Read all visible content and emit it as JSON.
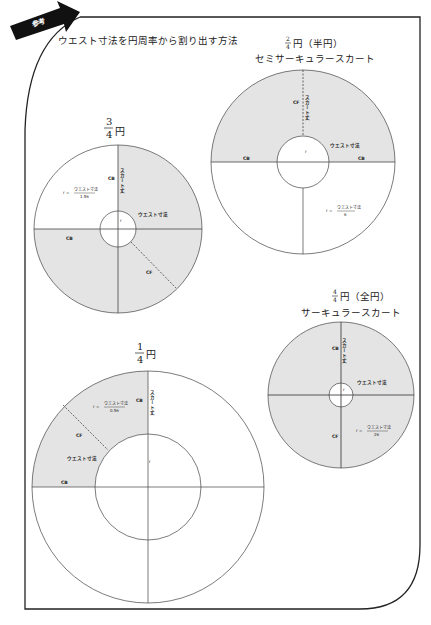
{
  "banner": {
    "label": "参考",
    "color": "#111111"
  },
  "header": {
    "title": "ウエスト寸法を円周率から割り出す方法"
  },
  "colors": {
    "fill": "#e4e4e4",
    "stroke": "#444444",
    "frame": "#222222"
  },
  "diagrams": [
    {
      "id": "half",
      "fraction_num": "2",
      "fraction_den": "4",
      "title_suffix": "円（半円）",
      "subtitle": "セミサーキュラースカート",
      "labels": {
        "cf": "CF",
        "cb_left": "CB",
        "cb_right": "CB",
        "skirt": "スカート丈",
        "waist": "ウエスト寸法",
        "r": "r",
        "formula_lhs": "r =",
        "formula_num": "ウエスト寸法",
        "formula_den": "π"
      }
    },
    {
      "id": "three-quarter",
      "fraction_num": "3",
      "fraction_den": "4",
      "title_suffix": "円",
      "labels": {
        "cb_top": "CB",
        "cb_left": "CB",
        "cf": "CF",
        "skirt": "スカート丈",
        "waist": "ウエスト寸法",
        "r": "r",
        "formula_lhs": "r =",
        "formula_num": "ウエスト寸法",
        "formula_den": "1.5π"
      }
    },
    {
      "id": "full",
      "fraction_num": "4",
      "fraction_den": "4",
      "title_suffix": "円（全円）",
      "subtitle": "サーキュラースカート",
      "labels": {
        "cb": "CB",
        "cf": "CF",
        "skirt": "スカート丈",
        "waist": "ウエスト寸法",
        "r": "r",
        "formula_lhs": "r =",
        "formula_num": "ウエスト寸法",
        "formula_den": "2π"
      }
    },
    {
      "id": "quarter",
      "fraction_num": "1",
      "fraction_den": "4",
      "title_suffix": "円",
      "labels": {
        "cb_top": "CB",
        "cb_left": "CB",
        "cf": "CF",
        "skirt": "スカート丈",
        "waist": "ウエスト寸法",
        "r": "r",
        "formula_lhs": "r =",
        "formula_num": "ウエスト寸法",
        "formula_den": "0.5π"
      }
    }
  ]
}
